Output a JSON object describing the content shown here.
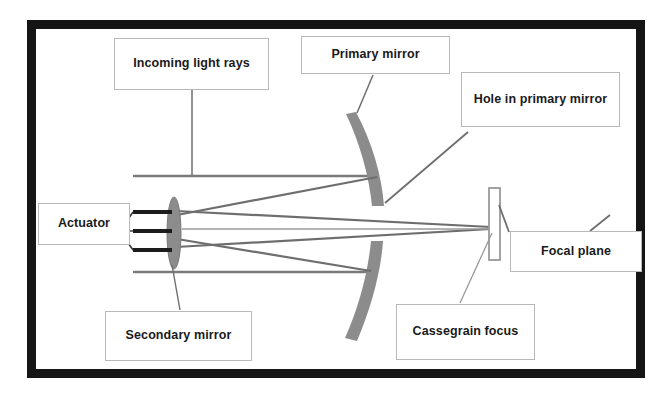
{
  "diagram": {
    "frame_color": "#151515",
    "mirror_color": "#8c8c8c",
    "ray_color": "#6e6e6e",
    "label_border_color": "#b9b9b9",
    "background_color": "#ffffff"
  },
  "labels": {
    "incoming_light_rays": "Incoming light rays",
    "primary_mirror": "Primary mirror",
    "hole_in_primary_mirror": "Hole in primary mirror",
    "actuator": "Actuator",
    "focal_plane": "Focal plane",
    "secondary_mirror": "Secondary mirror",
    "cassegrain_focus": "Cassegrain focus"
  },
  "components": {
    "primary_mirror_upper_arc": "upper concave primary mirror segment",
    "primary_mirror_lower_arc": "lower concave primary mirror segment",
    "secondary_mirror_ellipse": "convex secondary mirror",
    "focal_plane_plate": "focal plane detector plate",
    "actuator_arms": 3,
    "incoming_ray_count": 2,
    "hole_gap": "central aperture between primary mirror segments"
  }
}
